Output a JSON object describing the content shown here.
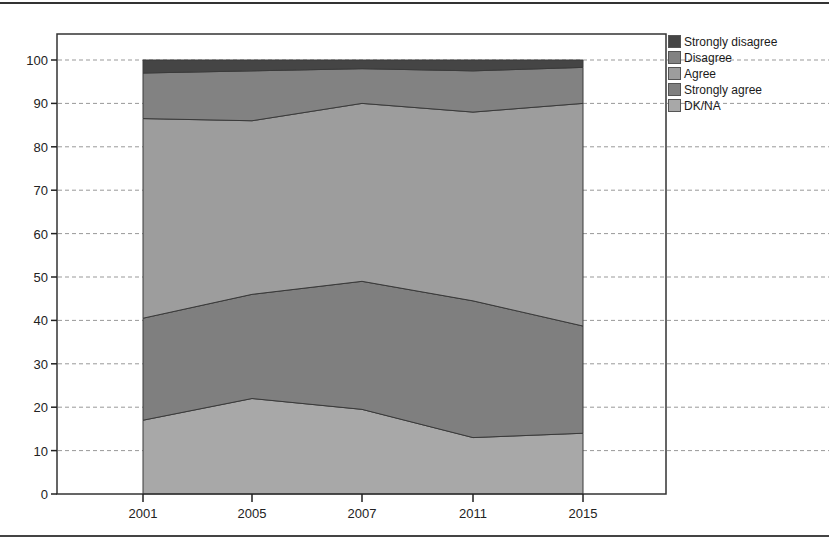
{
  "chart_data": {
    "type": "area",
    "stacked": true,
    "title": "",
    "xlabel": "",
    "ylabel": "",
    "categories": [
      "2001",
      "2005",
      "2007",
      "2011",
      "2015"
    ],
    "ylim": [
      0,
      100
    ],
    "yticks": [
      0,
      10,
      20,
      30,
      40,
      50,
      60,
      70,
      80,
      90,
      100
    ],
    "grid": "horizontal dashed",
    "legend_position": "right",
    "series": [
      {
        "name": "DK/NA",
        "color": "#a8a8a8",
        "values": [
          17,
          22,
          19.5,
          13,
          14
        ]
      },
      {
        "name": "Strongly agree",
        "color": "#7f7f7f",
        "values": [
          23.5,
          24,
          29.5,
          31.5,
          24.7
        ]
      },
      {
        "name": "Agree",
        "color": "#9d9d9d",
        "values": [
          46,
          40,
          41,
          43.5,
          51.3
        ]
      },
      {
        "name": "Disagree",
        "color": "#828282",
        "values": [
          10.5,
          11.5,
          8,
          9.5,
          8.3
        ]
      },
      {
        "name": "Strongly disagree",
        "color": "#454545",
        "values": [
          3,
          2.5,
          2,
          2.5,
          1.7
        ]
      }
    ]
  },
  "legend": {
    "items": [
      {
        "label": "Strongly disagree",
        "color": "#454545"
      },
      {
        "label": "Disagree",
        "color": "#828282"
      },
      {
        "label": "Agree",
        "color": "#9d9d9d"
      },
      {
        "label": "Strongly agree",
        "color": "#7f7f7f"
      },
      {
        "label": "DK/NA",
        "color": "#a8a8a8"
      }
    ]
  }
}
